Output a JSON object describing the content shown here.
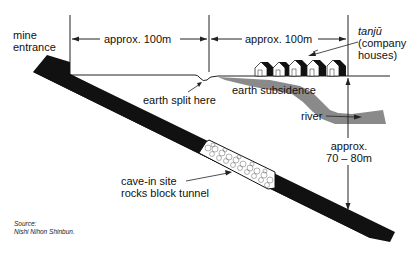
{
  "diagram": {
    "labels": {
      "mine_entrance_line1": "mine",
      "mine_entrance_line2": "entrance",
      "distance_1": "approx. 100m",
      "distance_2": "approx. 100m",
      "tanju": "tanjū",
      "company_houses_line1": "(company",
      "company_houses_line2": "houses)",
      "earth_split": "earth split here",
      "earth_subsidence": "earth subsidence",
      "river": "river",
      "depth_line1": "approx.",
      "depth_line2": "70 – 80m",
      "cave_in_line1": "cave-in site",
      "cave_in_line2": "rocks block tunnel"
    },
    "source": {
      "line1": "Source:",
      "line2": "Nishi Nihon Shinbun."
    },
    "colors": {
      "tunnel": "#111111",
      "river": "#8a8a8a",
      "lines": "#222222",
      "rocks": "#ffffff"
    }
  }
}
